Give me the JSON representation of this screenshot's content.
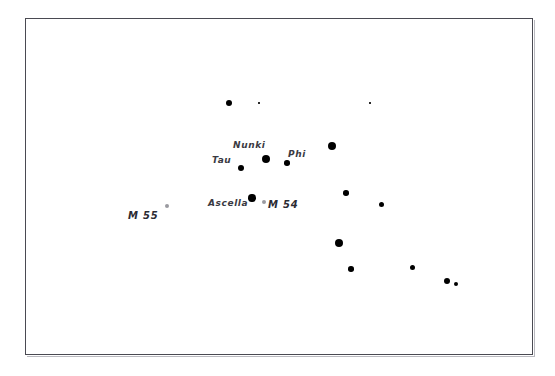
{
  "chart_data": {
    "type": "scatter",
    "title": "",
    "subtitle": "",
    "xlabel": "",
    "ylabel": "",
    "xlim": [
      0,
      508
    ],
    "ylim": [
      0,
      337
    ],
    "grid": false,
    "legend": "none",
    "background_color": "#ffffff",
    "frame_color": "#4a4a52",
    "star_color": "#000000",
    "deep_sky_object_color": "#9a9aa0",
    "label_color": "#3a3a42",
    "series": [
      {
        "name": "stars",
        "marker": "filled-circle",
        "points": [
          {
            "label": "",
            "x": 203,
            "y": 84,
            "size": 6.5
          },
          {
            "label": "",
            "x": 233,
            "y": 84,
            "size": 1.6
          },
          {
            "label": "",
            "x": 344,
            "y": 84,
            "size": 1.6
          },
          {
            "label": "Nunki",
            "x": 240,
            "y": 140,
            "size": 8.0
          },
          {
            "label": "Phi",
            "x": 261,
            "y": 144,
            "size": 5.6
          },
          {
            "label": "",
            "x": 306,
            "y": 127,
            "size": 8.0
          },
          {
            "label": "Tau",
            "x": 215,
            "y": 149,
            "size": 6.6
          },
          {
            "label": "Ascella",
            "x": 226,
            "y": 179,
            "size": 7.4
          },
          {
            "label": "",
            "x": 320,
            "y": 174,
            "size": 5.6
          },
          {
            "label": "",
            "x": 355,
            "y": 185,
            "size": 5.0
          },
          {
            "label": "",
            "x": 313,
            "y": 224,
            "size": 8.0
          },
          {
            "label": "",
            "x": 325,
            "y": 250,
            "size": 5.6
          },
          {
            "label": "",
            "x": 386,
            "y": 248,
            "size": 5.0
          },
          {
            "label": "",
            "x": 421,
            "y": 262,
            "size": 6.2
          },
          {
            "label": "",
            "x": 430,
            "y": 265,
            "size": 4.2
          }
        ]
      },
      {
        "name": "deep-sky-objects",
        "marker": "open-circle",
        "points": [
          {
            "label": "M 55",
            "x": 141,
            "y": 187,
            "size": 4.4
          },
          {
            "label": "M 54",
            "x": 238,
            "y": 183,
            "size": 4.4
          }
        ]
      }
    ],
    "labels": [
      {
        "name": "Nunki",
        "text": "Nunki",
        "x": 207,
        "y": 122
      },
      {
        "name": "Phi",
        "text": "Phi",
        "x": 262,
        "y": 131
      },
      {
        "name": "Tau",
        "text": "Tau",
        "x": 186,
        "y": 137
      },
      {
        "name": "Ascella",
        "text": "Ascella",
        "x": 182,
        "y": 180
      },
      {
        "name": "M 54",
        "text": "M 54",
        "x": 242,
        "y": 181
      },
      {
        "name": "M 55",
        "text": "M 55",
        "x": 102,
        "y": 192
      }
    ]
  }
}
